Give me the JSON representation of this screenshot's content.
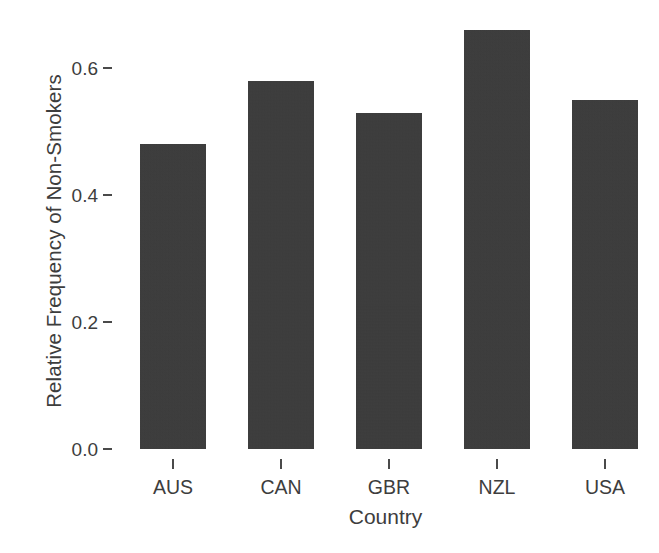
{
  "chart_data": {
    "type": "bar",
    "title": "",
    "subtitle": "",
    "xlabel": "Country",
    "ylabel": "Relative Frequency of Non-Smokers",
    "categories": [
      "AUS",
      "CAN",
      "GBR",
      "NZL",
      "USA"
    ],
    "values": [
      0.48,
      0.58,
      0.53,
      0.66,
      0.55
    ],
    "series": [
      {
        "name": "Relative Frequency of Non-Smokers",
        "values": [
          0.48,
          0.58,
          0.53,
          0.66,
          0.55
        ]
      }
    ],
    "ylim": [
      0.0,
      0.695
    ],
    "ytick_values": [
      0.0,
      0.2,
      0.4,
      0.6
    ],
    "ytick_labels": [
      "0.0",
      "0.2",
      "0.4",
      "0.6"
    ],
    "grid": false,
    "legend": null,
    "legend_position": "none",
    "bar_color": "#3a3a3a",
    "background_color": "#ffffff",
    "axis_color": "#4a4a4a",
    "text_color": "#3d3d3d"
  },
  "axes": {
    "y": {
      "title": "Relative Frequency of Non-Smokers",
      "ticks": [
        {
          "label": "0.6",
          "value": 0.6
        },
        {
          "label": "0.4",
          "value": 0.4
        },
        {
          "label": "0.2",
          "value": 0.2
        },
        {
          "label": "0.0",
          "value": 0.0
        }
      ]
    },
    "x": {
      "title": "Country",
      "ticks": [
        {
          "label": "AUS"
        },
        {
          "label": "CAN"
        },
        {
          "label": "GBR"
        },
        {
          "label": "NZL"
        },
        {
          "label": "USA"
        }
      ]
    }
  }
}
